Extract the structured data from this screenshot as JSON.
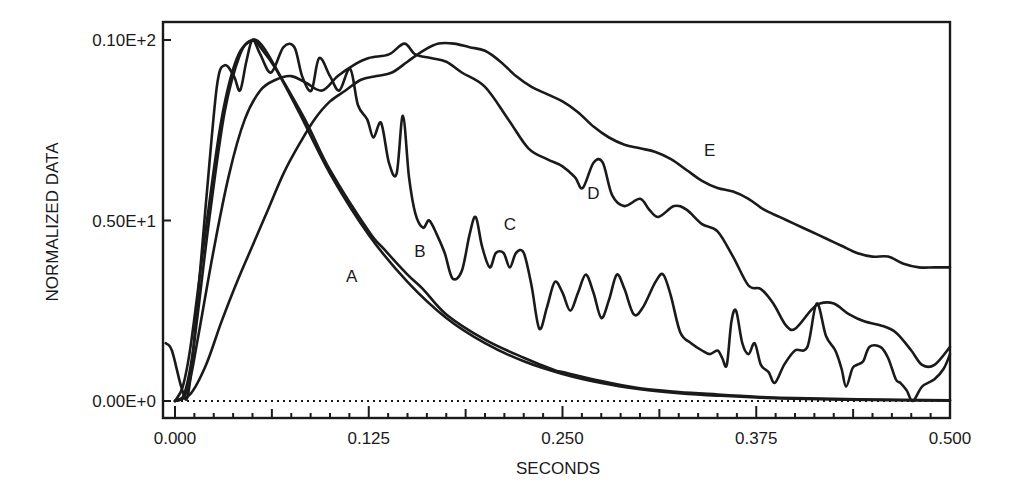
{
  "chart_data": {
    "type": "line",
    "title": "",
    "xlabel": "SECONDS",
    "ylabel": "NORMALIZED DATA",
    "xlim": [
      -0.008,
      0.5
    ],
    "ylim": [
      0,
      10
    ],
    "x_ticks": [
      0.0,
      0.125,
      0.25,
      0.375,
      0.5
    ],
    "x_tick_labels": [
      "0.000",
      "0.125",
      "0.250",
      "0.375",
      "0.500"
    ],
    "y_ticks": [
      0,
      5,
      10
    ],
    "y_tick_labels": [
      "0.00E+0",
      "0.50E+1",
      "0.10E+2"
    ],
    "grid": false,
    "legend": "none (curves labeled inline)",
    "baseline": {
      "style": "dotted",
      "y": 0
    },
    "series": [
      {
        "name": "A",
        "label_pos": {
          "x": 0.114,
          "y": 3.3
        },
        "points": [
          [
            0.0,
            0.0
          ],
          [
            0.005,
            0.4
          ],
          [
            0.01,
            1.5
          ],
          [
            0.02,
            4.8
          ],
          [
            0.03,
            7.8
          ],
          [
            0.04,
            9.5
          ],
          [
            0.05,
            10.0
          ],
          [
            0.055,
            9.8
          ],
          [
            0.065,
            9.2
          ],
          [
            0.08,
            8.0
          ],
          [
            0.1,
            6.3
          ],
          [
            0.125,
            4.6
          ],
          [
            0.15,
            3.3
          ],
          [
            0.175,
            2.3
          ],
          [
            0.2,
            1.6
          ],
          [
            0.225,
            1.1
          ],
          [
            0.25,
            0.75
          ],
          [
            0.275,
            0.5
          ],
          [
            0.3,
            0.33
          ],
          [
            0.325,
            0.22
          ],
          [
            0.35,
            0.15
          ],
          [
            0.375,
            0.1
          ],
          [
            0.4,
            0.06
          ],
          [
            0.45,
            0.03
          ],
          [
            0.5,
            0.01
          ]
        ]
      },
      {
        "name": "B",
        "label_pos": {
          "x": 0.158,
          "y": 4.0
        },
        "points": [
          [
            0.0,
            0.0
          ],
          [
            0.006,
            0.2
          ],
          [
            0.012,
            1.5
          ],
          [
            0.022,
            5.0
          ],
          [
            0.032,
            8.0
          ],
          [
            0.042,
            9.6
          ],
          [
            0.05,
            10.0
          ],
          [
            0.057,
            9.8
          ],
          [
            0.068,
            9.0
          ],
          [
            0.085,
            7.7
          ],
          [
            0.1,
            6.4
          ],
          [
            0.125,
            4.7
          ],
          [
            0.135,
            4.2
          ],
          [
            0.15,
            3.5
          ],
          [
            0.16,
            3.1
          ],
          [
            0.175,
            2.4
          ],
          [
            0.2,
            1.7
          ],
          [
            0.225,
            1.2
          ],
          [
            0.245,
            0.85
          ],
          [
            0.25,
            0.8
          ],
          [
            0.275,
            0.55
          ],
          [
            0.3,
            0.35
          ],
          [
            0.325,
            0.25
          ],
          [
            0.35,
            0.18
          ],
          [
            0.375,
            0.12
          ],
          [
            0.4,
            0.08
          ],
          [
            0.45,
            0.04
          ],
          [
            0.5,
            0.02
          ]
        ]
      },
      {
        "name": "C",
        "label_pos": {
          "x": 0.216,
          "y": 4.75
        },
        "points": [
          [
            -0.006,
            1.6
          ],
          [
            -0.002,
            1.4
          ],
          [
            0.004,
            0.4
          ],
          [
            0.008,
            0.1
          ],
          [
            0.012,
            1.5
          ],
          [
            0.02,
            5.5
          ],
          [
            0.027,
            8.7
          ],
          [
            0.032,
            9.3
          ],
          [
            0.038,
            9.0
          ],
          [
            0.042,
            8.6
          ],
          [
            0.046,
            9.4
          ],
          [
            0.05,
            10.0
          ],
          [
            0.055,
            9.6
          ],
          [
            0.062,
            9.1
          ],
          [
            0.07,
            9.8
          ],
          [
            0.077,
            9.8
          ],
          [
            0.082,
            9.0
          ],
          [
            0.088,
            8.6
          ],
          [
            0.093,
            9.5
          ],
          [
            0.1,
            9.0
          ],
          [
            0.106,
            8.6
          ],
          [
            0.113,
            9.2
          ],
          [
            0.118,
            8.2
          ],
          [
            0.124,
            7.8
          ],
          [
            0.128,
            7.3
          ],
          [
            0.133,
            7.7
          ],
          [
            0.138,
            6.6
          ],
          [
            0.143,
            6.3
          ],
          [
            0.147,
            7.9
          ],
          [
            0.151,
            6.2
          ],
          [
            0.155,
            5.2
          ],
          [
            0.16,
            4.8
          ],
          [
            0.164,
            5.0
          ],
          [
            0.169,
            4.6
          ],
          [
            0.174,
            4.1
          ],
          [
            0.179,
            3.4
          ],
          [
            0.185,
            3.6
          ],
          [
            0.19,
            4.6
          ],
          [
            0.194,
            5.1
          ],
          [
            0.198,
            4.3
          ],
          [
            0.203,
            3.7
          ],
          [
            0.207,
            4.1
          ],
          [
            0.212,
            4.1
          ],
          [
            0.216,
            3.7
          ],
          [
            0.22,
            4.1
          ],
          [
            0.225,
            4.1
          ],
          [
            0.23,
            3.2
          ],
          [
            0.235,
            2.0
          ],
          [
            0.24,
            2.6
          ],
          [
            0.245,
            3.3
          ],
          [
            0.25,
            3.0
          ],
          [
            0.255,
            2.5
          ],
          [
            0.26,
            3.0
          ],
          [
            0.265,
            3.5
          ],
          [
            0.27,
            3.0
          ],
          [
            0.275,
            2.3
          ],
          [
            0.28,
            2.8
          ],
          [
            0.285,
            3.5
          ],
          [
            0.29,
            3.1
          ],
          [
            0.296,
            2.4
          ],
          [
            0.302,
            2.6
          ],
          [
            0.31,
            3.3
          ],
          [
            0.315,
            3.5
          ],
          [
            0.32,
            2.9
          ],
          [
            0.326,
            1.9
          ],
          [
            0.333,
            1.6
          ],
          [
            0.34,
            1.4
          ],
          [
            0.345,
            1.3
          ],
          [
            0.35,
            1.4
          ],
          [
            0.353,
            1.2
          ],
          [
            0.356,
            1.0
          ],
          [
            0.359,
            2.2
          ],
          [
            0.362,
            2.5
          ],
          [
            0.366,
            1.6
          ],
          [
            0.37,
            1.3
          ],
          [
            0.374,
            1.6
          ],
          [
            0.378,
            1.0
          ],
          [
            0.383,
            0.8
          ],
          [
            0.387,
            0.5
          ],
          [
            0.393,
            1.0
          ],
          [
            0.4,
            1.4
          ],
          [
            0.408,
            1.5
          ],
          [
            0.414,
            2.7
          ],
          [
            0.42,
            1.8
          ],
          [
            0.426,
            1.4
          ],
          [
            0.43,
            0.9
          ],
          [
            0.433,
            0.4
          ],
          [
            0.437,
            0.9
          ],
          [
            0.44,
            1.0
          ],
          [
            0.444,
            1.1
          ],
          [
            0.448,
            1.5
          ],
          [
            0.455,
            1.5
          ],
          [
            0.46,
            1.2
          ],
          [
            0.465,
            0.6
          ],
          [
            0.468,
            0.5
          ],
          [
            0.472,
            0.3
          ],
          [
            0.476,
            0.0
          ],
          [
            0.482,
            0.4
          ],
          [
            0.49,
            0.6
          ],
          [
            0.496,
            0.9
          ],
          [
            0.5,
            1.3
          ]
        ]
      },
      {
        "name": "D",
        "label_pos": {
          "x": 0.27,
          "y": 5.6
        },
        "points": [
          [
            0.0,
            0.0
          ],
          [
            0.008,
            0.3
          ],
          [
            0.015,
            1.8
          ],
          [
            0.025,
            4.2
          ],
          [
            0.035,
            6.3
          ],
          [
            0.045,
            7.8
          ],
          [
            0.055,
            8.6
          ],
          [
            0.065,
            8.9
          ],
          [
            0.075,
            9.0
          ],
          [
            0.085,
            8.8
          ],
          [
            0.095,
            8.6
          ],
          [
            0.105,
            9.0
          ],
          [
            0.115,
            9.3
          ],
          [
            0.125,
            9.5
          ],
          [
            0.138,
            9.6
          ],
          [
            0.148,
            9.9
          ],
          [
            0.155,
            9.6
          ],
          [
            0.165,
            9.5
          ],
          [
            0.175,
            9.4
          ],
          [
            0.185,
            9.1
          ],
          [
            0.2,
            8.7
          ],
          [
            0.215,
            7.8
          ],
          [
            0.228,
            7.0
          ],
          [
            0.24,
            6.7
          ],
          [
            0.25,
            6.5
          ],
          [
            0.258,
            6.2
          ],
          [
            0.263,
            5.9
          ],
          [
            0.27,
            6.6
          ],
          [
            0.276,
            6.6
          ],
          [
            0.282,
            5.7
          ],
          [
            0.29,
            5.4
          ],
          [
            0.3,
            5.6
          ],
          [
            0.306,
            5.3
          ],
          [
            0.312,
            5.1
          ],
          [
            0.322,
            5.4
          ],
          [
            0.33,
            5.3
          ],
          [
            0.34,
            4.9
          ],
          [
            0.35,
            4.7
          ],
          [
            0.36,
            4.0
          ],
          [
            0.37,
            3.2
          ],
          [
            0.378,
            3.1
          ],
          [
            0.386,
            2.7
          ],
          [
            0.394,
            2.1
          ],
          [
            0.4,
            2.0
          ],
          [
            0.41,
            2.5
          ],
          [
            0.416,
            2.7
          ],
          [
            0.425,
            2.7
          ],
          [
            0.435,
            2.4
          ],
          [
            0.445,
            2.2
          ],
          [
            0.455,
            2.1
          ],
          [
            0.465,
            1.9
          ],
          [
            0.475,
            1.4
          ],
          [
            0.482,
            1.0
          ],
          [
            0.49,
            1.0
          ],
          [
            0.5,
            1.5
          ]
        ]
      },
      {
        "name": "E",
        "label_pos": {
          "x": 0.345,
          "y": 6.8
        },
        "points": [
          [
            0.0,
            0.0
          ],
          [
            0.01,
            0.2
          ],
          [
            0.02,
            1.0
          ],
          [
            0.03,
            2.2
          ],
          [
            0.04,
            3.3
          ],
          [
            0.05,
            4.3
          ],
          [
            0.06,
            5.3
          ],
          [
            0.07,
            6.3
          ],
          [
            0.08,
            7.1
          ],
          [
            0.09,
            7.8
          ],
          [
            0.1,
            8.3
          ],
          [
            0.11,
            8.6
          ],
          [
            0.12,
            8.9
          ],
          [
            0.13,
            9.0
          ],
          [
            0.14,
            9.1
          ],
          [
            0.15,
            9.4
          ],
          [
            0.16,
            9.7
          ],
          [
            0.17,
            9.9
          ],
          [
            0.18,
            9.9
          ],
          [
            0.19,
            9.8
          ],
          [
            0.2,
            9.7
          ],
          [
            0.21,
            9.4
          ],
          [
            0.22,
            9.0
          ],
          [
            0.23,
            8.7
          ],
          [
            0.24,
            8.5
          ],
          [
            0.25,
            8.3
          ],
          [
            0.26,
            8.0
          ],
          [
            0.27,
            7.6
          ],
          [
            0.28,
            7.3
          ],
          [
            0.29,
            7.1
          ],
          [
            0.3,
            7.0
          ],
          [
            0.31,
            6.9
          ],
          [
            0.32,
            6.7
          ],
          [
            0.33,
            6.4
          ],
          [
            0.34,
            6.1
          ],
          [
            0.35,
            5.9
          ],
          [
            0.36,
            5.8
          ],
          [
            0.37,
            5.6
          ],
          [
            0.38,
            5.3
          ],
          [
            0.39,
            5.1
          ],
          [
            0.4,
            4.9
          ],
          [
            0.41,
            4.7
          ],
          [
            0.42,
            4.5
          ],
          [
            0.43,
            4.3
          ],
          [
            0.44,
            4.1
          ],
          [
            0.45,
            4.0
          ],
          [
            0.46,
            4.0
          ],
          [
            0.47,
            3.8
          ],
          [
            0.48,
            3.7
          ],
          [
            0.49,
            3.7
          ],
          [
            0.5,
            3.7
          ]
        ]
      }
    ]
  }
}
